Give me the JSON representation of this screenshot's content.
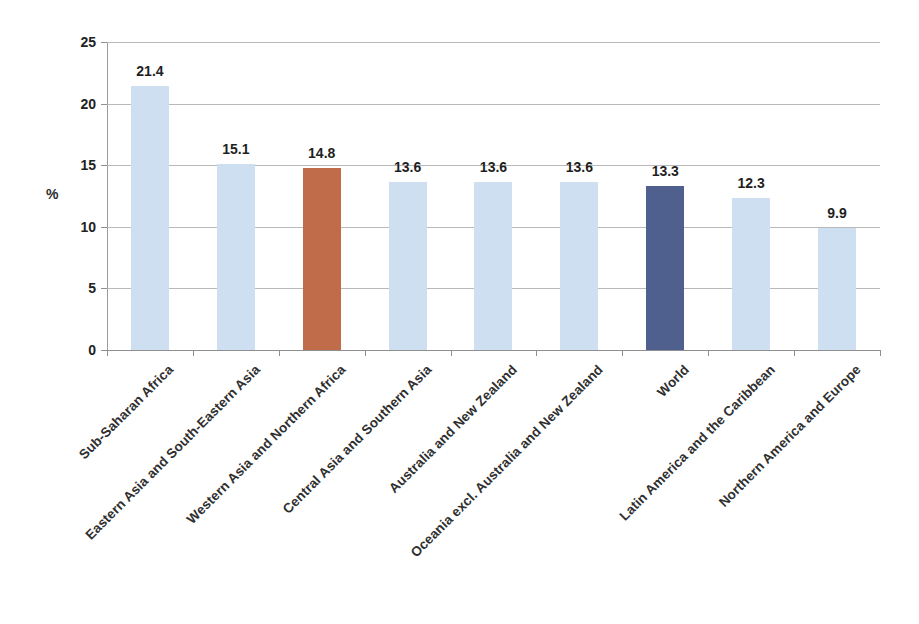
{
  "chart_data": {
    "type": "bar",
    "title": "",
    "subtitle": "",
    "xlabel": "",
    "ylabel": "%",
    "ylim": [
      0,
      25
    ],
    "yticks": [
      0,
      5,
      10,
      15,
      20,
      25
    ],
    "ytick_labels": [
      "0",
      "5",
      "10",
      "15",
      "20",
      "25"
    ],
    "grid": true,
    "legend": "none",
    "categories": [
      "Sub-Saharan Africa",
      "Eastern Asia and South-Eastern Asia",
      "Western Asia and Northern Africa",
      "Central Asia and Southern Asia",
      "Australia and New Zealand",
      "Oceania excl. Australia and New Zealand",
      "World",
      "Latin America and the Caribbean",
      "Northern America and Europe"
    ],
    "values": [
      21.4,
      15.1,
      14.8,
      13.6,
      13.6,
      13.6,
      13.3,
      12.3,
      9.9
    ],
    "value_labels": [
      "21.4",
      "15.1",
      "14.8",
      "13.6",
      "13.6",
      "13.6",
      "13.3",
      "12.3",
      "9.9"
    ],
    "bar_colors": [
      "#cfdff2",
      "#cfdff2",
      "#c06c4a",
      "#cfdff2",
      "#cfdff2",
      "#cfdff2",
      "#4f5f8e",
      "#cfdff2",
      "#cfdff2"
    ],
    "colors": {
      "default_bar": "#cfdff2",
      "highlight_bar": "#c06c4a",
      "world_bar": "#4f5f8e",
      "gridline": "#b9b9b9",
      "axis": "#8f8f8f",
      "text": "#2b2b2b",
      "background": "#ffffff"
    }
  }
}
